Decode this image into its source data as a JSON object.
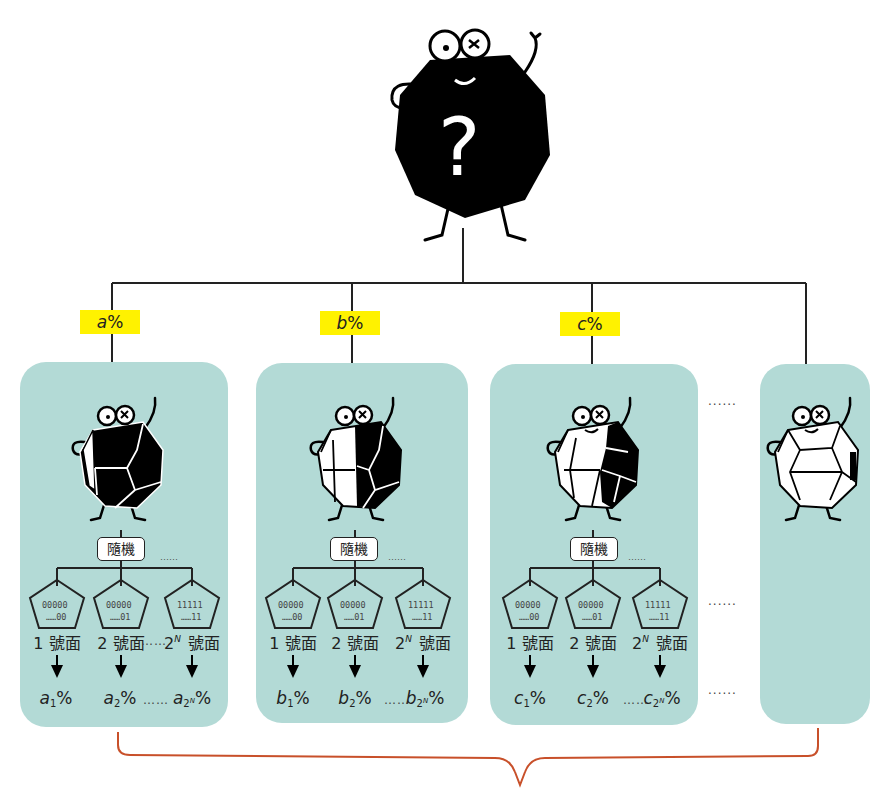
{
  "root": {
    "name": "unknown-state-character",
    "symbol": "?"
  },
  "branches": [
    {
      "id": "a",
      "weight_label": {
        "var": "a",
        "pct": "%"
      },
      "random_label": "隨機",
      "faces": [
        {
          "bits_top": "00000",
          "bits_bottom": "……00",
          "num": "1",
          "sup": "",
          "suffix": " 號面"
        },
        {
          "bits_top": "00000",
          "bits_bottom": "……01",
          "num": "2",
          "sup": "",
          "suffix": " 號面"
        },
        {
          "bits_top": "11111",
          "bits_bottom": "……11",
          "num": "2",
          "sup": "N",
          "suffix": " 號面"
        }
      ],
      "probs": [
        {
          "var": "a",
          "sub": "1",
          "subsup": "",
          "pct": "%"
        },
        {
          "var": "a",
          "sub": "2",
          "subsup": "",
          "pct": "%"
        },
        {
          "var": "a",
          "sub": "2",
          "subsup": "N",
          "pct": "%"
        }
      ]
    },
    {
      "id": "b",
      "weight_label": {
        "var": "b",
        "pct": "%"
      },
      "random_label": "隨機",
      "faces": [
        {
          "bits_top": "00000",
          "bits_bottom": "……00",
          "num": "1",
          "sup": "",
          "suffix": " 號面"
        },
        {
          "bits_top": "00000",
          "bits_bottom": "……01",
          "num": "2",
          "sup": "",
          "suffix": " 號面"
        },
        {
          "bits_top": "11111",
          "bits_bottom": "……11",
          "num": "2",
          "sup": "N",
          "suffix": " 號面"
        }
      ],
      "probs": [
        {
          "var": "b",
          "sub": "1",
          "subsup": "",
          "pct": "%"
        },
        {
          "var": "b",
          "sub": "2",
          "subsup": "",
          "pct": "%"
        },
        {
          "var": "b",
          "sub": "2",
          "subsup": "N",
          "pct": "%"
        }
      ]
    },
    {
      "id": "c",
      "weight_label": {
        "var": "c",
        "pct": "%"
      },
      "random_label": "隨機",
      "faces": [
        {
          "bits_top": "00000",
          "bits_bottom": "……00",
          "num": "1",
          "sup": "",
          "suffix": " 號面"
        },
        {
          "bits_top": "00000",
          "bits_bottom": "……01",
          "num": "2",
          "sup": "",
          "suffix": " 號面"
        },
        {
          "bits_top": "11111",
          "bits_bottom": "……11",
          "num": "2",
          "sup": "N",
          "suffix": " 號面"
        }
      ],
      "probs": [
        {
          "var": "c",
          "sub": "1",
          "subsup": "",
          "pct": "%"
        },
        {
          "var": "c",
          "sub": "2",
          "subsup": "",
          "pct": "%"
        },
        {
          "var": "c",
          "sub": "2",
          "subsup": "N",
          "pct": "%"
        }
      ]
    }
  ],
  "ellipsis": "……",
  "ellipsis_long": "······",
  "colors": {
    "panel": "#b3dad6",
    "tag": "#fff200",
    "brace": "#c8502a",
    "line": "#222222"
  }
}
